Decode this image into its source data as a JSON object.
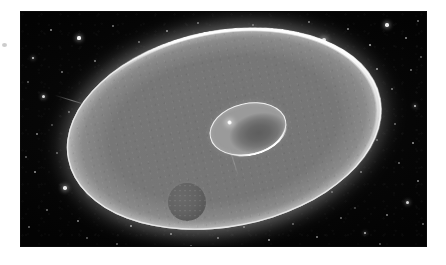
{
  "page": {
    "width": 446,
    "height": 265,
    "background_color": "#ffffff",
    "caption": ""
  },
  "plate": {
    "name": "astronomical-plate",
    "alt_text": "Grayscale astronomical illustration: a large tilted elliptical ring or disk with a bright limb, a small inner ellipse containing a bright point-like nucleus, and a small crescent-lit sphere resting on the lower-left limb, set against a dense starfield.",
    "frame": {
      "left": 21,
      "top": 12,
      "width": 405,
      "height": 234
    },
    "background_color": "#040404"
  },
  "objects": {
    "outer_disk": {
      "label": "outer-disk",
      "shape": "ellipse",
      "center": {
        "x": 50,
        "y": 50
      },
      "size": {
        "width": 318,
        "height": 196
      },
      "rotation_deg": -11,
      "fill_color": "#757575",
      "rim_color": "#ebebeb",
      "glow_color": "#bebebe"
    },
    "inner_ellipse": {
      "label": "inner-ellipse",
      "shape": "ellipse",
      "position": {
        "left": 188,
        "top": 91
      },
      "size": {
        "width": 78,
        "height": 52
      },
      "rotation_deg": -13,
      "fill_color": "#666666",
      "rim_color": "#f5f5f5"
    },
    "nucleus": {
      "label": "bright-nucleus",
      "shape": "point",
      "color": "#ffffff",
      "size_px": 5
    },
    "moon": {
      "label": "small-sphere",
      "shape": "circle",
      "position": {
        "left": 147,
        "top": 171
      },
      "diameter": 38,
      "fill_color": "#636363",
      "crescent_color": "#ffffff"
    },
    "streaks": [
      {
        "label": "plate-streak-upper-left",
        "left": 33,
        "top": 88,
        "length": 36,
        "rotation_deg": 17
      },
      {
        "label": "plate-streak-center",
        "left": 198,
        "top": 150,
        "length": 30,
        "rotation_deg": 72
      }
    ]
  },
  "starfield": {
    "description": "dense scattered point sources over the dark sky",
    "count": 92,
    "star_color": "#ffffff",
    "stars": [
      {
        "x": 30,
        "y": 18,
        "r": 1.0,
        "b": 0.55
      },
      {
        "x": 58,
        "y": 26,
        "r": 1.6,
        "b": 0.95
      },
      {
        "x": 92,
        "y": 14,
        "r": 0.9,
        "b": 0.45
      },
      {
        "x": 118,
        "y": 30,
        "r": 0.8,
        "b": 0.4
      },
      {
        "x": 146,
        "y": 19,
        "r": 1.1,
        "b": 0.6
      },
      {
        "x": 177,
        "y": 11,
        "r": 0.9,
        "b": 0.45
      },
      {
        "x": 203,
        "y": 24,
        "r": 1.3,
        "b": 0.75
      },
      {
        "x": 232,
        "y": 13,
        "r": 0.8,
        "b": 0.38
      },
      {
        "x": 259,
        "y": 20,
        "r": 1.0,
        "b": 0.52
      },
      {
        "x": 288,
        "y": 10,
        "r": 0.9,
        "b": 0.48
      },
      {
        "x": 303,
        "y": 28,
        "r": 2.0,
        "b": 1.0
      },
      {
        "x": 327,
        "y": 17,
        "r": 1.0,
        "b": 0.55
      },
      {
        "x": 349,
        "y": 33,
        "r": 1.2,
        "b": 0.68
      },
      {
        "x": 366,
        "y": 13,
        "r": 1.7,
        "b": 0.92
      },
      {
        "x": 385,
        "y": 26,
        "r": 1.0,
        "b": 0.55
      },
      {
        "x": 397,
        "y": 9,
        "r": 0.8,
        "b": 0.4
      },
      {
        "x": 12,
        "y": 46,
        "r": 1.4,
        "b": 0.8
      },
      {
        "x": 41,
        "y": 60,
        "r": 0.9,
        "b": 0.45
      },
      {
        "x": 74,
        "y": 49,
        "r": 1.0,
        "b": 0.5
      },
      {
        "x": 22,
        "y": 84,
        "r": 1.5,
        "b": 0.85
      },
      {
        "x": 48,
        "y": 100,
        "r": 0.9,
        "b": 0.45
      },
      {
        "x": 16,
        "y": 122,
        "r": 1.0,
        "b": 0.52
      },
      {
        "x": 36,
        "y": 141,
        "r": 0.8,
        "b": 0.38
      },
      {
        "x": 14,
        "y": 160,
        "r": 1.1,
        "b": 0.58
      },
      {
        "x": 44,
        "y": 176,
        "r": 1.8,
        "b": 0.95
      },
      {
        "x": 70,
        "y": 181,
        "r": 1.6,
        "b": 0.88
      },
      {
        "x": 26,
        "y": 198,
        "r": 0.9,
        "b": 0.44
      },
      {
        "x": 57,
        "y": 209,
        "r": 1.0,
        "b": 0.52
      },
      {
        "x": 90,
        "y": 196,
        "r": 0.8,
        "b": 0.4
      },
      {
        "x": 110,
        "y": 214,
        "r": 1.2,
        "b": 0.66
      },
      {
        "x": 133,
        "y": 198,
        "r": 0.9,
        "b": 0.45
      },
      {
        "x": 150,
        "y": 222,
        "r": 1.1,
        "b": 0.58
      },
      {
        "x": 174,
        "y": 207,
        "r": 0.8,
        "b": 0.38
      },
      {
        "x": 197,
        "y": 226,
        "r": 1.0,
        "b": 0.5
      },
      {
        "x": 223,
        "y": 215,
        "r": 0.9,
        "b": 0.44
      },
      {
        "x": 248,
        "y": 228,
        "r": 1.2,
        "b": 0.64
      },
      {
        "x": 272,
        "y": 212,
        "r": 0.8,
        "b": 0.36
      },
      {
        "x": 296,
        "y": 225,
        "r": 1.0,
        "b": 0.52
      },
      {
        "x": 320,
        "y": 206,
        "r": 0.9,
        "b": 0.42
      },
      {
        "x": 344,
        "y": 221,
        "r": 1.3,
        "b": 0.72
      },
      {
        "x": 366,
        "y": 203,
        "r": 1.0,
        "b": 0.5
      },
      {
        "x": 386,
        "y": 190,
        "r": 1.5,
        "b": 0.84
      },
      {
        "x": 397,
        "y": 169,
        "r": 1.0,
        "b": 0.52
      },
      {
        "x": 378,
        "y": 151,
        "r": 0.9,
        "b": 0.42
      },
      {
        "x": 392,
        "y": 131,
        "r": 1.1,
        "b": 0.58
      },
      {
        "x": 374,
        "y": 112,
        "r": 0.8,
        "b": 0.38
      },
      {
        "x": 394,
        "y": 94,
        "r": 1.4,
        "b": 0.78
      },
      {
        "x": 371,
        "y": 77,
        "r": 1.0,
        "b": 0.5
      },
      {
        "x": 390,
        "y": 58,
        "r": 0.9,
        "b": 0.44
      },
      {
        "x": 356,
        "y": 57,
        "r": 1.2,
        "b": 0.65
      },
      {
        "x": 334,
        "y": 69,
        "r": 1.9,
        "b": 0.98
      },
      {
        "x": 314,
        "y": 52,
        "r": 0.8,
        "b": 0.38
      },
      {
        "x": 347,
        "y": 92,
        "r": 1.0,
        "b": 0.5
      },
      {
        "x": 326,
        "y": 108,
        "r": 0.8,
        "b": 0.36
      },
      {
        "x": 356,
        "y": 128,
        "r": 0.9,
        "b": 0.42
      },
      {
        "x": 340,
        "y": 160,
        "r": 1.0,
        "b": 0.48
      },
      {
        "x": 311,
        "y": 180,
        "r": 0.8,
        "b": 0.36
      },
      {
        "x": 281,
        "y": 193,
        "r": 0.9,
        "b": 0.4
      },
      {
        "x": 60,
        "y": 131,
        "r": 0.8,
        "b": 0.36
      },
      {
        "x": 85,
        "y": 157,
        "r": 0.9,
        "b": 0.42
      },
      {
        "x": 104,
        "y": 171,
        "r": 0.8,
        "b": 0.34
      },
      {
        "x": 129,
        "y": 162,
        "r": 1.0,
        "b": 0.46
      },
      {
        "x": 249,
        "y": 42,
        "r": 0.7,
        "b": 0.3
      },
      {
        "x": 163,
        "y": 45,
        "r": 0.7,
        "b": 0.3
      },
      {
        "x": 130,
        "y": 39,
        "r": 0.8,
        "b": 0.36
      },
      {
        "x": 188,
        "y": 96,
        "r": 0.7,
        "b": 0.28
      },
      {
        "x": 119,
        "y": 121,
        "r": 0.7,
        "b": 0.26
      },
      {
        "x": 142,
        "y": 142,
        "r": 0.7,
        "b": 0.26
      },
      {
        "x": 230,
        "y": 165,
        "r": 0.7,
        "b": 0.28
      },
      {
        "x": 266,
        "y": 155,
        "r": 0.7,
        "b": 0.26
      },
      {
        "x": 7,
        "y": 70,
        "r": 0.8,
        "b": 0.34
      },
      {
        "x": 5,
        "y": 145,
        "r": 0.8,
        "b": 0.34
      },
      {
        "x": 8,
        "y": 215,
        "r": 0.9,
        "b": 0.4
      },
      {
        "x": 66,
        "y": 226,
        "r": 0.8,
        "b": 0.34
      },
      {
        "x": 96,
        "y": 232,
        "r": 0.9,
        "b": 0.38
      },
      {
        "x": 170,
        "y": 234,
        "r": 0.8,
        "b": 0.32
      },
      {
        "x": 239,
        "y": 196,
        "r": 0.7,
        "b": 0.26
      },
      {
        "x": 359,
        "y": 232,
        "r": 0.8,
        "b": 0.32
      },
      {
        "x": 402,
        "y": 212,
        "r": 0.9,
        "b": 0.4
      },
      {
        "x": 400,
        "y": 45,
        "r": 0.8,
        "b": 0.34
      },
      {
        "x": 283,
        "y": 40,
        "r": 0.7,
        "b": 0.28
      },
      {
        "x": 219,
        "y": 55,
        "r": 0.6,
        "b": 0.22
      },
      {
        "x": 155,
        "y": 66,
        "r": 0.6,
        "b": 0.22
      },
      {
        "x": 99,
        "y": 92,
        "r": 0.6,
        "b": 0.22
      },
      {
        "x": 78,
        "y": 118,
        "r": 0.6,
        "b": 0.22
      },
      {
        "x": 190,
        "y": 180,
        "r": 0.6,
        "b": 0.22
      },
      {
        "x": 300,
        "y": 146,
        "r": 0.6,
        "b": 0.22
      },
      {
        "x": 258,
        "y": 78,
        "r": 0.6,
        "b": 0.2
      },
      {
        "x": 334,
        "y": 196,
        "r": 0.7,
        "b": 0.26
      },
      {
        "x": 52,
        "y": 156,
        "r": 0.7,
        "b": 0.28
      },
      {
        "x": 31,
        "y": 113,
        "r": 0.7,
        "b": 0.28
      },
      {
        "x": 408,
        "y": 106,
        "r": 0.8,
        "b": 0.34
      },
      {
        "x": 406,
        "y": 160,
        "r": 0.7,
        "b": 0.28
      }
    ]
  },
  "margin": {
    "mark_label": "stray-margin-mark"
  }
}
